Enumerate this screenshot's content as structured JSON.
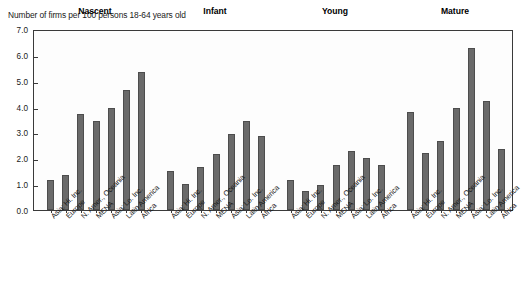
{
  "chart_data": {
    "type": "bar",
    "title": "",
    "ylabel": "Number of firms per 100 persons 18-64 years old",
    "xlabel": "",
    "ylim": [
      0.0,
      7.0
    ],
    "ytick_labels": [
      "7.0",
      "6.0",
      "5.0",
      "4.0",
      "3.0",
      "2.0",
      "1.0",
      "0.0"
    ],
    "ytick_values": [
      7.0,
      6.0,
      5.0,
      4.0,
      3.0,
      2.0,
      1.0,
      0.0
    ],
    "grid": false,
    "legend": "none",
    "bar_color": "#6a6a6a",
    "categories": [
      "Asia: Hi. Inc.",
      "Europe",
      "N. Amer., Oceania",
      "MENA",
      "Asia: Lo. Inc.",
      "Latin America",
      "Africa"
    ],
    "groups": [
      {
        "name": "Nascent",
        "values": [
          1.15,
          1.35,
          3.7,
          3.45,
          3.95,
          4.65,
          5.35
        ]
      },
      {
        "name": "Infant",
        "values": [
          1.5,
          1.0,
          1.65,
          2.15,
          2.95,
          3.45,
          2.85
        ]
      },
      {
        "name": "Young",
        "values": [
          1.15,
          0.75,
          0.95,
          1.75,
          2.3,
          2.0,
          1.75
        ]
      },
      {
        "name": "Mature",
        "values": [
          3.8,
          2.2,
          2.65,
          3.95,
          6.25,
          4.2,
          2.35
        ]
      }
    ]
  }
}
